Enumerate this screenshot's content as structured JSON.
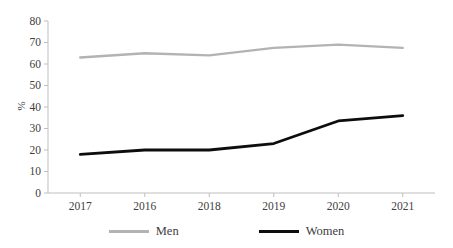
{
  "chart_data": {
    "type": "line",
    "title": "",
    "categories": [
      "2017",
      "2016",
      "2018",
      "2019",
      "2020",
      "2021"
    ],
    "series": [
      {
        "name": "Men",
        "color": "#b3b3b3",
        "values": [
          63,
          65,
          64,
          67.5,
          69,
          67.5
        ]
      },
      {
        "name": "Women",
        "color": "#0d0d0d",
        "values": [
          18,
          20,
          20,
          23,
          33.5,
          36
        ]
      }
    ],
    "xlabel": "",
    "ylabel": "%",
    "ylim": [
      0,
      80
    ],
    "yticks": [
      0,
      10,
      20,
      30,
      40,
      50,
      60,
      70,
      80
    ],
    "grid": false,
    "legend_position": "bottom",
    "axis_color": "#bfbfbf",
    "text_color": "#404040"
  }
}
